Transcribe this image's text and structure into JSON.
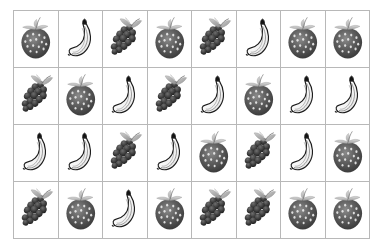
{
  "figure": {
    "type": "fruit-icon-grid",
    "columns": 8,
    "rows": 4,
    "background_color": "#ffffff",
    "gridline_color": "#b8b8b8"
  },
  "legend": {
    "fruit_kinds": [
      "strawberry",
      "banana",
      "grapes"
    ]
  },
  "grid": {
    "rows": [
      {
        "index": 1,
        "cells": [
          "strawberry",
          "banana",
          "grapes",
          "strawberry",
          "grapes",
          "banana",
          "strawberry",
          "strawberry"
        ]
      },
      {
        "index": 2,
        "cells": [
          "grapes",
          "strawberry",
          "banana",
          "grapes",
          "banana",
          "strawberry",
          "banana",
          "banana"
        ]
      },
      {
        "index": 3,
        "cells": [
          "banana",
          "banana",
          "grapes",
          "banana",
          "strawberry",
          "grapes",
          "banana",
          "strawberry"
        ]
      },
      {
        "index": 4,
        "cells": [
          "grapes",
          "strawberry",
          "banana",
          "strawberry",
          "grapes",
          "grapes",
          "strawberry",
          "strawberry"
        ]
      }
    ]
  },
  "counts": {
    "strawberry": 12,
    "banana": 11,
    "grapes": 9,
    "total": 32
  }
}
